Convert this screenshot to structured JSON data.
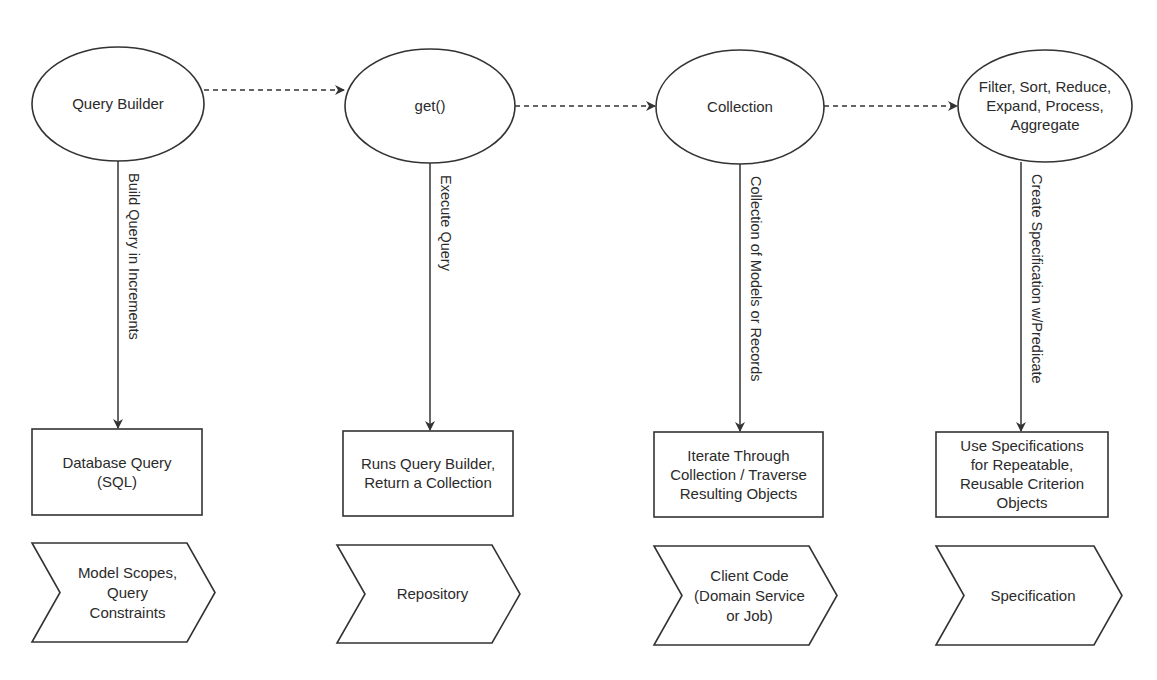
{
  "diagram": {
    "stages": [
      {
        "node": {
          "label_lines": [
            "Query Builder"
          ],
          "cx": 118,
          "cy": 104,
          "rx": 86,
          "ry": 57
        },
        "edge_label": "Build Query in Increments",
        "line": {
          "x": 118,
          "y1": 161,
          "y2": 428
        },
        "box": {
          "label_lines": [
            "Database Query",
            "(SQL)"
          ],
          "x": 32,
          "y": 429,
          "w": 170,
          "h": 86
        },
        "chevron": {
          "label_lines": [
            "Model Scopes,",
            "Query",
            "Constraints"
          ],
          "x": 32,
          "y": 543,
          "w": 183,
          "h": 99,
          "notch": 28
        }
      },
      {
        "node": {
          "label_lines": [
            "get()"
          ],
          "cx": 430,
          "cy": 106,
          "rx": 85,
          "ry": 57
        },
        "edge_label": "Execute Query",
        "line": {
          "x": 430,
          "y1": 163,
          "y2": 430
        },
        "box": {
          "label_lines": [
            "Runs Query Builder,",
            "Return a Collection"
          ],
          "x": 343,
          "y": 431,
          "w": 170,
          "h": 85
        },
        "chevron": {
          "label_lines": [
            "Repository"
          ],
          "x": 337,
          "y": 545,
          "w": 183,
          "h": 98,
          "notch": 28
        }
      },
      {
        "node": {
          "label_lines": [
            "Collection"
          ],
          "cx": 740,
          "cy": 107,
          "rx": 84,
          "ry": 57
        },
        "edge_label": "Collection of Models or Records",
        "line": {
          "x": 740,
          "y1": 164,
          "y2": 431
        },
        "box": {
          "label_lines": [
            "Iterate Through",
            "Collection / Traverse",
            "Resulting Objects"
          ],
          "x": 654,
          "y": 432,
          "w": 169,
          "h": 85
        },
        "chevron": {
          "label_lines": [
            "Client Code",
            "(Domain Service",
            "or Job)"
          ],
          "x": 654,
          "y": 546,
          "w": 183,
          "h": 99,
          "notch": 28
        }
      },
      {
        "node": {
          "label_lines": [
            "Filter, Sort, Reduce,",
            "Expand, Process,",
            "Aggregate"
          ],
          "cx": 1045,
          "cy": 106,
          "rx": 87,
          "ry": 56
        },
        "edge_label": "Create Specification w/Predicate",
        "line": {
          "x": 1021,
          "y1": 162,
          "y2": 431
        },
        "box": {
          "label_lines": [
            "Use Specifications",
            "for Repeatable,",
            "Reusable Criterion",
            "Objects"
          ],
          "x": 936,
          "y": 432,
          "w": 172,
          "h": 85
        },
        "chevron": {
          "label_lines": [
            "Specification"
          ],
          "x": 936,
          "y": 546,
          "w": 186,
          "h": 99,
          "notch": 28
        }
      }
    ],
    "flow_arrows": [
      {
        "from": "Query Builder",
        "to": "get()",
        "x1": 204,
        "y": 90,
        "x2": 344
      },
      {
        "from": "get()",
        "to": "Collection",
        "x1": 515,
        "y": 106,
        "x2": 655
      },
      {
        "from": "Collection",
        "to": "Filter, Sort, Reduce, Expand, Process, Aggregate",
        "x1": 824,
        "y": 106,
        "x2": 957
      }
    ],
    "colors": {
      "stroke": "#333333",
      "text": "#2b2b2b",
      "background": "#ffffff"
    }
  }
}
